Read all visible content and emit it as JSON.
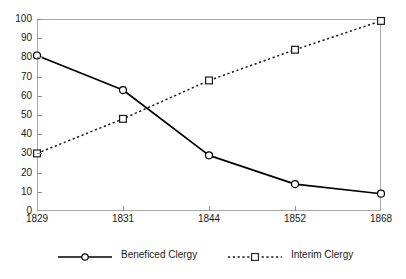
{
  "chart_data": {
    "type": "line",
    "title": "",
    "subtitle": "",
    "xlabel": "",
    "ylabel": "",
    "categories": [
      "1829",
      "1831",
      "1844",
      "1852",
      "1868"
    ],
    "series": [
      {
        "name": "Beneficed Clergy",
        "values": [
          81,
          63,
          29,
          14,
          9
        ],
        "line_style": "solid",
        "marker": "circle",
        "color": "#000000"
      },
      {
        "name": "Interim Clergy",
        "values": [
          30,
          48,
          68,
          84,
          99
        ],
        "line_style": "dotted",
        "marker": "square",
        "color": "#1a1a1a"
      }
    ],
    "ylim": [
      0,
      100
    ],
    "ytick_step": 10,
    "yticks": [
      "0",
      "10",
      "20",
      "30",
      "40",
      "50",
      "60",
      "70",
      "80",
      "90",
      "100"
    ],
    "xticks": [
      "1829",
      "1831",
      "1844",
      "1852",
      "1868"
    ],
    "grid": false,
    "legend_position": "bottom",
    "legend": [
      "Beneficed Clergy",
      "Interim Clergy"
    ],
    "frame_color": "#a8a8a8",
    "background": "#ffffff"
  }
}
